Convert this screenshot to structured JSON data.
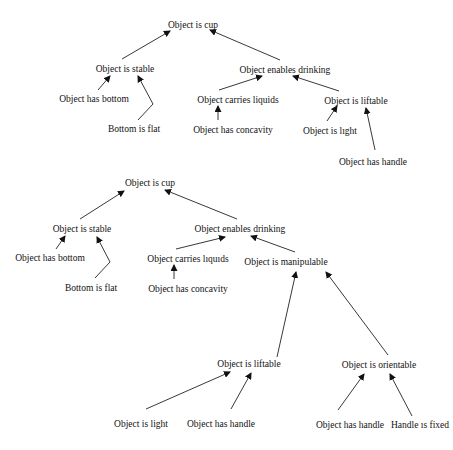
{
  "diagrams": [
    {
      "name": "tree-1",
      "nodes": [
        {
          "id": "cup",
          "label": "Object is cup",
          "x": 193,
          "y": 28
        },
        {
          "id": "stable",
          "label": "Object is stable",
          "x": 125,
          "y": 72
        },
        {
          "id": "bottom",
          "label": "Object has bottom",
          "x": 94,
          "y": 102
        },
        {
          "id": "flat",
          "label": "Bottom is flat",
          "x": 134,
          "y": 132
        },
        {
          "id": "drinking",
          "label": "Object enables drinking",
          "x": 285,
          "y": 73
        },
        {
          "id": "liquids",
          "label": "Object carries liquids",
          "x": 238,
          "y": 103
        },
        {
          "id": "concavity",
          "label": "Object has concavity",
          "x": 233,
          "y": 133
        },
        {
          "id": "liftable",
          "label": "Object is liftable",
          "x": 356,
          "y": 104
        },
        {
          "id": "light",
          "label": "Object is lıght",
          "x": 330,
          "y": 134
        },
        {
          "id": "handle",
          "label": "Object has handle",
          "x": 373,
          "y": 165
        }
      ],
      "edges": [
        {
          "from": [
            122,
            59
          ],
          "to": [
            170,
            31
          ],
          "via": null
        },
        {
          "from": [
            280,
            60
          ],
          "to": [
            210,
            30
          ],
          "via": null
        },
        {
          "from": [
            98,
            90
          ],
          "to": [
            110,
            76
          ],
          "via": null
        },
        {
          "from": [
            138,
            120
          ],
          "to": [
            138,
            76
          ],
          "via": [
            153,
            104
          ]
        },
        {
          "from": [
            219,
            90
          ],
          "to": [
            262,
            76
          ],
          "via": null
        },
        {
          "from": [
            218,
            120
          ],
          "to": [
            218,
            106
          ],
          "via": null
        },
        {
          "from": [
            339,
            91
          ],
          "to": [
            293,
            76
          ],
          "via": null
        },
        {
          "from": [
            327,
            121
          ],
          "to": [
            337,
            106
          ],
          "via": null
        },
        {
          "from": [
            375,
            150
          ],
          "to": [
            366,
            108
          ],
          "via": null
        }
      ]
    },
    {
      "name": "tree-2",
      "nodes": [
        {
          "id": "cup",
          "label": "Object is cup",
          "x": 150,
          "y": 186
        },
        {
          "id": "stable",
          "label": "Object is stable",
          "x": 82,
          "y": 232
        },
        {
          "id": "bottom",
          "label": "Object has bottom",
          "x": 50,
          "y": 261
        },
        {
          "id": "flat",
          "label": "Bottom is flat",
          "x": 91,
          "y": 291
        },
        {
          "id": "drinking",
          "label": "Object enables drinking",
          "x": 240,
          "y": 232
        },
        {
          "id": "liquids",
          "label": "Object carries lıquıds",
          "x": 188,
          "y": 262
        },
        {
          "id": "concavity",
          "label": "Object has concavity",
          "x": 188,
          "y": 292
        },
        {
          "id": "manipulable",
          "label": "Object is manipulable",
          "x": 286,
          "y": 265
        },
        {
          "id": "liftable",
          "label": "Object is liftable",
          "x": 249,
          "y": 367
        },
        {
          "id": "orientable",
          "label": "Object is orientable",
          "x": 379,
          "y": 368
        },
        {
          "id": "light",
          "label": "Object is light",
          "x": 141,
          "y": 427
        },
        {
          "id": "handle1",
          "label": "Object has handle",
          "x": 221,
          "y": 427
        },
        {
          "id": "handle2",
          "label": "Object has handle",
          "x": 350,
          "y": 428
        },
        {
          "id": "fixed",
          "label": "Handle ıs fixed",
          "x": 420,
          "y": 428
        }
      ],
      "edges": [
        {
          "from": [
            80,
            219
          ],
          "to": [
            124,
            191
          ],
          "via": null
        },
        {
          "from": [
            237,
            219
          ],
          "to": [
            165,
            190
          ],
          "via": null
        },
        {
          "from": [
            56,
            249
          ],
          "to": [
            65,
            236
          ],
          "via": null
        },
        {
          "from": [
            95,
            278
          ],
          "to": [
            97,
            237
          ],
          "via": [
            110,
            262
          ]
        },
        {
          "from": [
            176,
            249
          ],
          "to": [
            225,
            237
          ],
          "via": null
        },
        {
          "from": [
            174,
            279
          ],
          "to": [
            174,
            265
          ],
          "via": null
        },
        {
          "from": [
            295,
            252
          ],
          "to": [
            251,
            236
          ],
          "via": null
        },
        {
          "from": [
            277,
            357
          ],
          "to": [
            296,
            272
          ],
          "via": null
        },
        {
          "from": [
            388,
            355
          ],
          "to": [
            326,
            272
          ],
          "via": null
        },
        {
          "from": [
            146,
            409
          ],
          "to": [
            230,
            372
          ],
          "via": null
        },
        {
          "from": [
            231,
            409
          ],
          "to": [
            251,
            373
          ],
          "via": null
        },
        {
          "from": [
            338,
            410
          ],
          "to": [
            364,
            374
          ],
          "via": null
        },
        {
          "from": [
            412,
            416
          ],
          "to": [
            390,
            374
          ],
          "via": null
        }
      ]
    }
  ],
  "colors": {
    "background": "#ffffff",
    "line": "#222222",
    "text": "#111111"
  }
}
